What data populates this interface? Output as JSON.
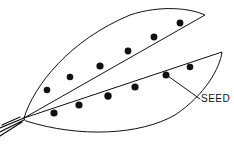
{
  "diagram": {
    "labels": [
      {
        "text": "SEED",
        "points_to": "seed"
      }
    ],
    "parts": [
      "upper-pod-half",
      "lower-pod-half",
      "stem",
      "seeds"
    ],
    "seed_count_upper": 6,
    "seed_count_lower": 7
  },
  "colors": {
    "line": "#111111",
    "background": "#ffffff"
  }
}
